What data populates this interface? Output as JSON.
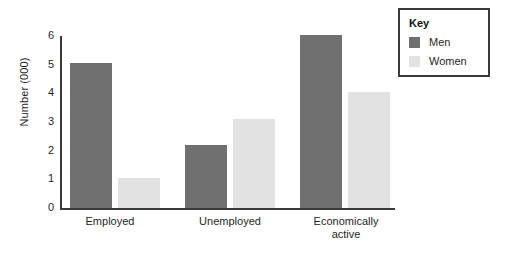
{
  "chart_data": {
    "type": "bar",
    "title": "",
    "xlabel": "",
    "ylabel": "Number (000)",
    "categories": [
      "Employed",
      "Unemployed",
      "Economically active"
    ],
    "series": [
      {
        "name": "Men",
        "color": "#707070",
        "values": [
          5.05,
          2.2,
          6.05
        ]
      },
      {
        "name": "Women",
        "color": "#e2e2e2",
        "values": [
          1.05,
          3.1,
          4.05
        ]
      }
    ],
    "ylim": [
      0,
      6
    ],
    "y_ticks": [
      "0",
      "1",
      "2",
      "3",
      "4",
      "5",
      "6"
    ],
    "grid": false,
    "legend_position": "top-right"
  },
  "axis": {
    "y_title": "Number (000)",
    "ticks": [
      "6",
      "5",
      "4",
      "3",
      "2",
      "1",
      "0"
    ]
  },
  "categories": [
    {
      "label": "Employed",
      "line1": "Employed",
      "line2": ""
    },
    {
      "label": "Unemployed",
      "line1": "Unemployed",
      "line2": ""
    },
    {
      "label": "Economically active",
      "line1": "Economically",
      "line2": "active"
    }
  ],
  "legend": {
    "title": "Key",
    "items": [
      {
        "label": "Men",
        "color": "#707070"
      },
      {
        "label": "Women",
        "color": "#e2e2e2"
      }
    ]
  }
}
